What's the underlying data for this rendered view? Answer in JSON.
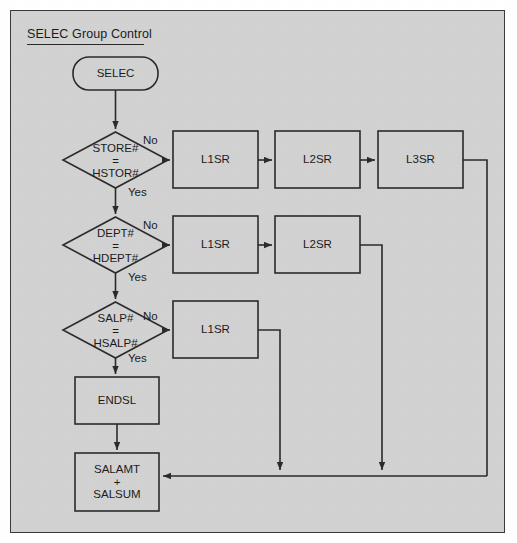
{
  "figure": {
    "title": "SELEC Group Control",
    "background_color": "#d2d2d2",
    "line_color": "#2a2a2a",
    "text_color": "#1a1a1a"
  },
  "nodes": {
    "start": {
      "label": "SELEC",
      "shape": "terminator"
    },
    "decision1": {
      "line1": "STORE#",
      "line2": "=",
      "line3": "HSTOR#",
      "shape": "decision"
    },
    "decision2": {
      "line1": "DEPT#",
      "line2": "=",
      "line3": "HDEPT#",
      "shape": "decision"
    },
    "decision3": {
      "line1": "SALP#",
      "line2": "=",
      "line3": "HSALP#",
      "shape": "decision"
    },
    "row1_box1": {
      "label": "L1SR",
      "shape": "process"
    },
    "row1_box2": {
      "label": "L2SR",
      "shape": "process"
    },
    "row1_box3": {
      "label": "L3SR",
      "shape": "process"
    },
    "row2_box1": {
      "label": "L1SR",
      "shape": "process"
    },
    "row2_box2": {
      "label": "L2SR",
      "shape": "process"
    },
    "row3_box1": {
      "label": "L1SR",
      "shape": "process"
    },
    "endsl": {
      "label": "ENDSL",
      "shape": "process"
    },
    "salamt": {
      "line1": "SALAMT",
      "line2": "+",
      "line3": "SALSUM",
      "shape": "process"
    }
  },
  "edge_labels": {
    "d1_no": "No",
    "d1_yes": "Yes",
    "d2_no": "No",
    "d2_yes": "Yes",
    "d3_no": "No",
    "d3_yes": "Yes"
  }
}
